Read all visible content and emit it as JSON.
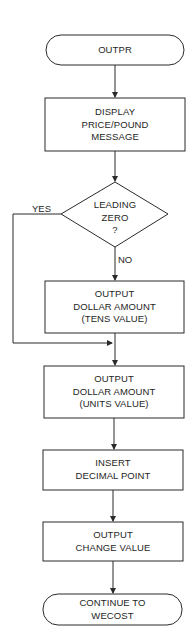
{
  "diagram": {
    "type": "flowchart",
    "stroke_color": "#2a2a2a",
    "background": "#ffffff",
    "nodes": {
      "start": {
        "shape": "terminal",
        "lines": [
          "OUTPR"
        ]
      },
      "display": {
        "shape": "process",
        "lines": [
          "DISPLAY",
          "PRICE/POUND",
          "MESSAGE"
        ]
      },
      "decision": {
        "shape": "decision",
        "lines": [
          "LEADING",
          "ZERO",
          "?"
        ]
      },
      "tens": {
        "shape": "process",
        "lines": [
          "OUTPUT",
          "DOLLAR AMOUNT",
          "(TENS VALUE)"
        ]
      },
      "units": {
        "shape": "process",
        "lines": [
          "OUTPUT",
          "DOLLAR AMOUNT",
          "(UNITS VALUE)"
        ]
      },
      "decimal": {
        "shape": "process",
        "lines": [
          "INSERT",
          "DECIMAL POINT"
        ]
      },
      "change": {
        "shape": "process",
        "lines": [
          "OUTPUT",
          "CHANGE VALUE"
        ]
      },
      "end": {
        "shape": "terminal",
        "lines": [
          "CONTINUE TO",
          "WECOST"
        ]
      }
    },
    "edges": {
      "yes_label": "YES",
      "no_label": "NO"
    }
  }
}
